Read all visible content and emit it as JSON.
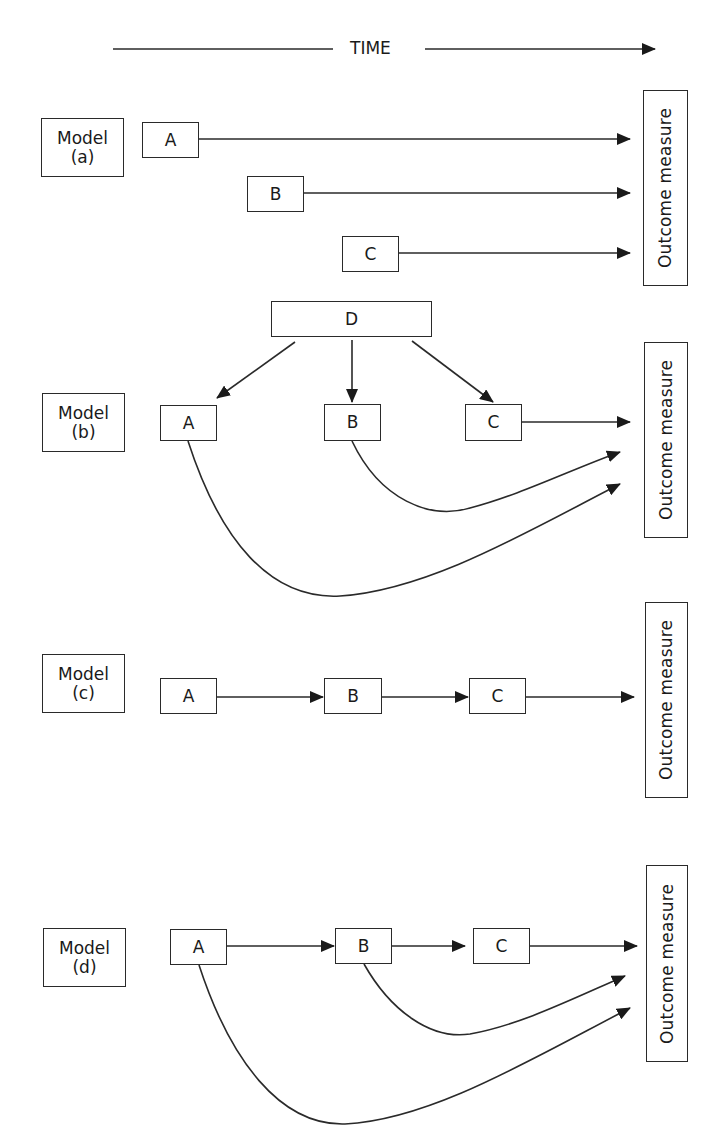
{
  "figure": {
    "time_axis": {
      "label": "TIME"
    },
    "outcome_label": "Outcome measure",
    "models": [
      {
        "id": "a",
        "label_line1": "Model",
        "label_line2": "(a)",
        "nodes": [
          "A",
          "B",
          "C"
        ],
        "edges": [
          [
            "A",
            "Outcome"
          ],
          [
            "B",
            "Outcome"
          ],
          [
            "C",
            "Outcome"
          ]
        ]
      },
      {
        "id": "b",
        "label_line1": "Model",
        "label_line2": "(b)",
        "nodes": [
          "D",
          "A",
          "B",
          "C"
        ],
        "edges": [
          [
            "D",
            "A"
          ],
          [
            "D",
            "B"
          ],
          [
            "D",
            "C"
          ],
          [
            "C",
            "Outcome"
          ],
          [
            "B",
            "Outcome"
          ],
          [
            "A",
            "Outcome"
          ]
        ]
      },
      {
        "id": "c",
        "label_line1": "Model",
        "label_line2": "(c)",
        "nodes": [
          "A",
          "B",
          "C"
        ],
        "edges": [
          [
            "A",
            "B"
          ],
          [
            "B",
            "C"
          ],
          [
            "C",
            "Outcome"
          ]
        ]
      },
      {
        "id": "d",
        "label_line1": "Model",
        "label_line2": "(d)",
        "nodes": [
          "A",
          "B",
          "C"
        ],
        "edges": [
          [
            "A",
            "B"
          ],
          [
            "B",
            "C"
          ],
          [
            "C",
            "Outcome"
          ],
          [
            "B",
            "Outcome"
          ],
          [
            "A",
            "Outcome"
          ]
        ]
      }
    ]
  }
}
